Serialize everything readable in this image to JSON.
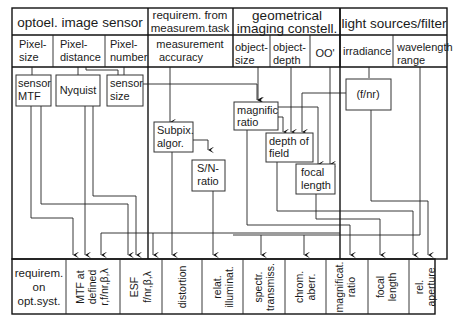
{
  "header": {
    "groups": [
      {
        "label": "optoel. image sensor"
      },
      {
        "label_lines": [
          "requirem. from",
          "measurem.task"
        ]
      },
      {
        "label_lines": [
          "geometrical",
          "imaging constell."
        ]
      },
      {
        "label": "light sources/filter"
      }
    ],
    "subheaders": [
      {
        "lines": [
          "Pixel-",
          "size"
        ]
      },
      {
        "lines": [
          "Pixel-",
          "distance"
        ]
      },
      {
        "lines": [
          "Pixel-",
          "number"
        ]
      },
      {
        "lines": [
          "measurement",
          "accuracy"
        ]
      },
      {
        "lines": [
          "object-",
          "size"
        ]
      },
      {
        "lines": [
          "object-",
          "depth"
        ]
      },
      {
        "lines": [
          "OO'"
        ]
      },
      {
        "lines": [
          "irradiance"
        ]
      },
      {
        "lines": [
          "wavelength",
          "range"
        ]
      }
    ]
  },
  "nodes": {
    "sensor_mtf": [
      "sensor",
      "MTF"
    ],
    "nyquist": [
      "Nyquist"
    ],
    "sensor_size": [
      "sensor",
      "size"
    ],
    "subpix": [
      "Subpix.",
      "algor."
    ],
    "sn_ratio": [
      "S/N-",
      "ratio"
    ],
    "magnific": [
      "magnific",
      "ratio"
    ],
    "depth_of_field": [
      "depth of",
      "field"
    ],
    "focal_length": [
      "focal",
      "length"
    ],
    "f_nr": [
      "(f/nr)"
    ]
  },
  "footer": {
    "row_label": [
      "requirem.",
      "on",
      "opt.syst."
    ],
    "columns": [
      {
        "lines": [
          "MTF at",
          "defined",
          "r,f/nr,β,λ"
        ]
      },
      {
        "lines": [
          "ESF",
          "f/nr,β,λ"
        ]
      },
      {
        "lines": [
          "distortion"
        ]
      },
      {
        "lines": [
          "relat.",
          "illuminat."
        ]
      },
      {
        "lines": [
          "spectr.",
          "transmiss."
        ]
      },
      {
        "lines": [
          "chrom.",
          "aberr."
        ]
      },
      {
        "lines": [
          "magnificat.",
          "ratio"
        ]
      },
      {
        "lines": [
          "focal",
          "length"
        ]
      },
      {
        "lines": [
          "rel.",
          "aperture"
        ]
      }
    ]
  }
}
